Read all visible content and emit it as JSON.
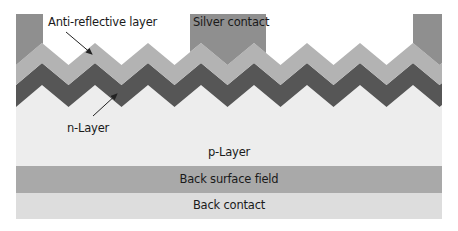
{
  "diagram": {
    "type": "solar-cell-cross-section",
    "labels": {
      "anti_reflective": "Anti-reflective layer",
      "silver_contact": "Silver contact",
      "n_layer": "n-Layer",
      "p_layer": "p-Layer",
      "back_surface_field": "Back surface field",
      "back_contact": "Back contact"
    },
    "colors": {
      "background": "#ffffff",
      "front_contact": "#8f8f8f",
      "anti_reflective": "#b3b3b3",
      "n_layer": "#565656",
      "p_layer": "#ededed",
      "back_surface_field": "#a9a9a9",
      "back_contact": "#dddddd",
      "arrow": "#222222"
    },
    "layers_top_to_bottom": [
      "Silver contact",
      "Anti-reflective layer",
      "n-Layer",
      "p-Layer",
      "Back surface field",
      "Back contact"
    ]
  }
}
